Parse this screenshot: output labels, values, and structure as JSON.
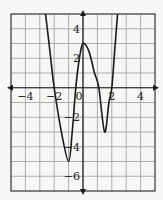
{
  "chart_data": {
    "type": "line",
    "title": "",
    "xlabel": "",
    "ylabel": "",
    "xlim": [
      -5,
      5
    ],
    "ylim": [
      -7,
      5
    ],
    "grid": true,
    "legend": null,
    "x_tick_labels": [
      {
        "value": -4,
        "label": "−4"
      },
      {
        "value": -2,
        "label": "−2"
      },
      {
        "value": 0,
        "label": "0"
      },
      {
        "value": 2,
        "label": "2"
      },
      {
        "value": 4,
        "label": "4"
      }
    ],
    "y_tick_labels": [
      {
        "value": 4,
        "label": "4"
      },
      {
        "value": 2,
        "label": "2"
      },
      {
        "value": -2,
        "label": "−2"
      },
      {
        "value": -4,
        "label": "−4"
      },
      {
        "value": -6,
        "label": "−6"
      }
    ],
    "series": [
      {
        "name": "f(x)",
        "points": [
          [
            -2.6,
            5
          ],
          [
            -2.3,
            2.5
          ],
          [
            -2,
            0
          ],
          [
            -1.5,
            -3
          ],
          [
            -1,
            -5
          ],
          [
            -0.75,
            -3
          ],
          [
            -0.5,
            0
          ],
          [
            -0.25,
            2
          ],
          [
            0,
            3
          ],
          [
            0.4,
            2.5
          ],
          [
            0.8,
            1
          ],
          [
            1.1,
            0
          ],
          [
            1.5,
            -3
          ],
          [
            1.8,
            -1
          ],
          [
            2,
            0
          ],
          [
            2.2,
            2.5
          ],
          [
            2.4,
            5
          ]
        ],
        "key_features": {
          "local_min_left": [
            -1,
            -5
          ],
          "local_max": [
            0,
            3
          ],
          "local_min_right": [
            1.5,
            -3
          ],
          "x_intercepts": [
            -2,
            -0.5,
            1.1,
            2
          ]
        }
      }
    ],
    "colors": {
      "curve": "#1a1a1a",
      "grid": "#9a9a9a",
      "axes": "#1a1a1a",
      "frame": "#333333",
      "background": "#f7f7f5"
    }
  }
}
